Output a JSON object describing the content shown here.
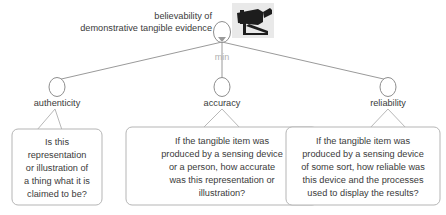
{
  "diagram": {
    "type": "goal-tree",
    "background": "#ffffff",
    "root": {
      "id": "root",
      "label_line1": "believability of",
      "label_line2": "demonstrative tangible evidence",
      "aggregation": "min",
      "node_shape": "ellipse",
      "icon": "security-camera-icon",
      "icon_background": "#e9e9e9",
      "icon_color": "#1d1d1d"
    },
    "children": [
      {
        "id": "authenticity",
        "label": "authenticity",
        "question_lines": [
          "Is this",
          "representation",
          "or illustration of",
          "a thing what it is",
          "claimed to be?"
        ]
      },
      {
        "id": "accuracy",
        "label": "accuracy",
        "question_lines": [
          "If the tangible item was",
          "produced by a sensing device",
          "or a person, how accurate",
          "was this representation or",
          "illustration?"
        ]
      },
      {
        "id": "reliability",
        "label": "reliability",
        "question_lines": [
          "If the tangible item was",
          "produced by a sensing device",
          "of some sort, how reliable was",
          "this device and the processes",
          "used to display the results?"
        ]
      }
    ],
    "colors": {
      "edge": "#9a9a9a",
      "node_stroke": "#8e8e8e",
      "bubble_stroke": "#b5b5b5",
      "text": "#3a3a3a",
      "muted_text": "#b0b0b0"
    }
  }
}
